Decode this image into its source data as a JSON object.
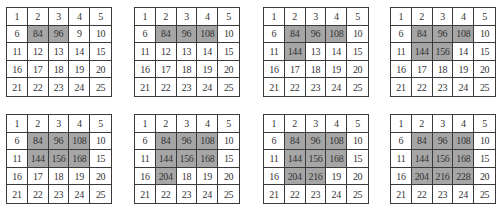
{
  "diagram": {
    "highlight_color": "#a6a6a6",
    "border_color": "#3a3a3a",
    "grids": [
      {
        "position": {
          "x": 6,
          "y": 7
        },
        "cells": [
          [
            "1",
            "2",
            "3",
            "4",
            "5"
          ],
          [
            "6",
            "84",
            "96",
            "9",
            "10"
          ],
          [
            "11",
            "12",
            "13",
            "14",
            "15"
          ],
          [
            "16",
            "17",
            "18",
            "19",
            "20"
          ],
          [
            "21",
            "22",
            "23",
            "24",
            "25"
          ]
        ],
        "highlighted": [
          [
            1,
            1
          ],
          [
            1,
            2
          ]
        ]
      },
      {
        "position": {
          "x": 134,
          "y": 7
        },
        "cells": [
          [
            "1",
            "2",
            "3",
            "4",
            "5"
          ],
          [
            "6",
            "84",
            "96",
            "108",
            "10"
          ],
          [
            "11",
            "12",
            "13",
            "14",
            "15"
          ],
          [
            "16",
            "17",
            "18",
            "19",
            "20"
          ],
          [
            "21",
            "22",
            "23",
            "24",
            "25"
          ]
        ],
        "highlighted": [
          [
            1,
            1
          ],
          [
            1,
            2
          ],
          [
            1,
            3
          ]
        ]
      },
      {
        "position": {
          "x": 263,
          "y": 7
        },
        "cells": [
          [
            "1",
            "2",
            "3",
            "4",
            "5"
          ],
          [
            "6",
            "84",
            "96",
            "108",
            "10"
          ],
          [
            "11",
            "144",
            "13",
            "14",
            "15"
          ],
          [
            "16",
            "17",
            "18",
            "19",
            "20"
          ],
          [
            "21",
            "22",
            "23",
            "24",
            "25"
          ]
        ],
        "highlighted": [
          [
            1,
            1
          ],
          [
            1,
            2
          ],
          [
            1,
            3
          ],
          [
            2,
            1
          ]
        ]
      },
      {
        "position": {
          "x": 390,
          "y": 7
        },
        "cells": [
          [
            "1",
            "2",
            "3",
            "4",
            "5"
          ],
          [
            "6",
            "84",
            "96",
            "108",
            "10"
          ],
          [
            "11",
            "144",
            "156",
            "14",
            "15"
          ],
          [
            "16",
            "17",
            "18",
            "19",
            "20"
          ],
          [
            "21",
            "22",
            "23",
            "24",
            "25"
          ]
        ],
        "highlighted": [
          [
            1,
            1
          ],
          [
            1,
            2
          ],
          [
            1,
            3
          ],
          [
            2,
            1
          ],
          [
            2,
            2
          ]
        ]
      },
      {
        "position": {
          "x": 6,
          "y": 114
        },
        "cells": [
          [
            "1",
            "2",
            "3",
            "4",
            "5"
          ],
          [
            "6",
            "84",
            "96",
            "108",
            "10"
          ],
          [
            "11",
            "144",
            "156",
            "168",
            "15"
          ],
          [
            "16",
            "17",
            "18",
            "19",
            "20"
          ],
          [
            "21",
            "22",
            "23",
            "24",
            "25"
          ]
        ],
        "highlighted": [
          [
            1,
            1
          ],
          [
            1,
            2
          ],
          [
            1,
            3
          ],
          [
            2,
            1
          ],
          [
            2,
            2
          ],
          [
            2,
            3
          ]
        ]
      },
      {
        "position": {
          "x": 134,
          "y": 114
        },
        "cells": [
          [
            "1",
            "2",
            "3",
            "4",
            "5"
          ],
          [
            "6",
            "84",
            "96",
            "108",
            "10"
          ],
          [
            "11",
            "144",
            "156",
            "168",
            "15"
          ],
          [
            "16",
            "204",
            "18",
            "19",
            "20"
          ],
          [
            "21",
            "22",
            "23",
            "24",
            "25"
          ]
        ],
        "highlighted": [
          [
            1,
            1
          ],
          [
            1,
            2
          ],
          [
            1,
            3
          ],
          [
            2,
            1
          ],
          [
            2,
            2
          ],
          [
            2,
            3
          ],
          [
            3,
            1
          ]
        ]
      },
      {
        "position": {
          "x": 263,
          "y": 114
        },
        "cells": [
          [
            "1",
            "2",
            "3",
            "4",
            "5"
          ],
          [
            "6",
            "84",
            "96",
            "108",
            "10"
          ],
          [
            "11",
            "144",
            "156",
            "168",
            "15"
          ],
          [
            "16",
            "204",
            "216",
            "19",
            "20"
          ],
          [
            "21",
            "22",
            "23",
            "24",
            "25"
          ]
        ],
        "highlighted": [
          [
            1,
            1
          ],
          [
            1,
            2
          ],
          [
            1,
            3
          ],
          [
            2,
            1
          ],
          [
            2,
            2
          ],
          [
            2,
            3
          ],
          [
            3,
            1
          ],
          [
            3,
            2
          ]
        ]
      },
      {
        "position": {
          "x": 390,
          "y": 114
        },
        "cells": [
          [
            "1",
            "2",
            "3",
            "4",
            "5"
          ],
          [
            "6",
            "84",
            "96",
            "108",
            "10"
          ],
          [
            "11",
            "144",
            "156",
            "168",
            "15"
          ],
          [
            "16",
            "204",
            "216",
            "228",
            "20"
          ],
          [
            "21",
            "22",
            "23",
            "24",
            "25"
          ]
        ],
        "highlighted": [
          [
            1,
            1
          ],
          [
            1,
            2
          ],
          [
            1,
            3
          ],
          [
            2,
            1
          ],
          [
            2,
            2
          ],
          [
            2,
            3
          ],
          [
            3,
            1
          ],
          [
            3,
            2
          ],
          [
            3,
            3
          ]
        ]
      }
    ]
  }
}
